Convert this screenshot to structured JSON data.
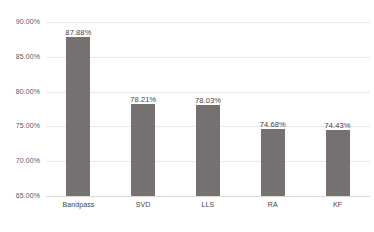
{
  "chart_data": {
    "type": "bar",
    "title": "",
    "subtitle": "",
    "xlabel": "",
    "ylabel": "",
    "categories": [
      "Bandpass",
      "SVD",
      "LLS",
      "RA",
      "KF"
    ],
    "values": [
      87.88,
      78.21,
      78.03,
      74.68,
      74.43
    ],
    "data_labels": [
      "87.88%",
      "78.21%",
      "78.03%",
      "74.68%",
      "74.43%"
    ],
    "ylim": [
      65.0,
      90.0
    ],
    "ytick_values": [
      90.0,
      85.0,
      80.0,
      75.0,
      70.0,
      65.0
    ],
    "ytick_labels": [
      "90.00%",
      "85.00%",
      "80.00%",
      "75.00%",
      "70.00%",
      "65.00%"
    ],
    "grid": true,
    "grid_axis": "y",
    "legend": false,
    "legend_position": "none",
    "bar_color": "#767171",
    "gridline_color": "#e8e8e8",
    "axis_line_color": "#d9d9d9",
    "label_text_color": "#3f3f3f",
    "tick_text_color": "#595959",
    "background_color": "#ffffff"
  }
}
